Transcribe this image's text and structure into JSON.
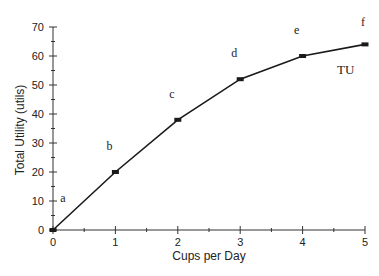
{
  "chart_data": {
    "type": "line",
    "title": "",
    "xlabel": "Cups per Day",
    "ylabel": "Total Utility (utils)",
    "x": [
      0,
      1,
      2,
      3,
      4,
      5
    ],
    "series": [
      {
        "name": "TU",
        "values": [
          0,
          20,
          38,
          52,
          60,
          64
        ],
        "point_labels": [
          "a",
          "b",
          "c",
          "d",
          "e",
          "f"
        ]
      }
    ],
    "xlim": [
      0,
      5
    ],
    "ylim": [
      0,
      70
    ],
    "x_ticks": [
      0,
      1,
      2,
      3,
      4,
      5
    ],
    "x_minor_step": 0.5,
    "y_ticks": [
      0,
      10,
      20,
      30,
      40,
      50,
      60,
      70
    ],
    "y_minor_step": 5,
    "grid": false,
    "legend": "inline label 'TU' near curve",
    "line_color": "#1a1a1a"
  }
}
